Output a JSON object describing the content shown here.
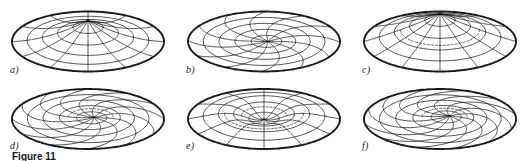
{
  "figure": {
    "kind": "multi-panel-surface-plot-figure",
    "panel_count": 6,
    "rows": 2,
    "columns": 3,
    "background_color": "#ffffff",
    "line_color": "#1a1a1a",
    "caption_fragment": "Figure 11"
  },
  "panels": [
    {
      "id": "a",
      "label": "a)",
      "shape": "shallow dome with single apex at centre, uniform radial mesh",
      "meridians": 12,
      "parallels": 4,
      "apex_offset_x": 0,
      "apex_offset_y": -4,
      "apex_height": 17,
      "twist": 0,
      "dip": 0,
      "cone": 0
    },
    {
      "id": "b",
      "label": "b)",
      "shape": "saddle / twisted sheet, mesh wraps through an off-centre node",
      "meridians": 12,
      "parallels": 4,
      "apex_offset_x": 4,
      "apex_offset_y": 2,
      "apex_height": 2,
      "twist": 0.55,
      "dip": 0,
      "cone": 0
    },
    {
      "id": "c",
      "label": "c)",
      "shape": "central cone rising from a circular rim, dashed hidden parallel",
      "meridians": 12,
      "parallels": 4,
      "apex_offset_x": 0,
      "apex_offset_y": -6,
      "apex_height": 22,
      "twist": 0,
      "dip": 0,
      "cone": 1
    },
    {
      "id": "d",
      "label": "d)",
      "shape": "spiral vortex, mesh lines converge into an off-centre singular point",
      "meridians": 12,
      "parallels": 4,
      "apex_offset_x": 6,
      "apex_offset_y": 1,
      "apex_height": 6,
      "twist": 1.05,
      "dip": 0.35,
      "cone": 0
    },
    {
      "id": "e",
      "label": "e)",
      "shape": "central funnel / depression with raised annular ring",
      "meridians": 12,
      "parallels": 4,
      "apex_offset_x": 0,
      "apex_offset_y": -3,
      "apex_height": 14,
      "twist": 0,
      "dip": 0.8,
      "cone": 1
    },
    {
      "id": "f",
      "label": "f)",
      "shape": "strongly twisted sheet, meridians sweep past an off-centre focus",
      "meridians": 12,
      "parallels": 4,
      "apex_offset_x": 10,
      "apex_offset_y": 0,
      "apex_height": 4,
      "twist": 1.4,
      "dip": 0.15,
      "cone": 0
    }
  ],
  "chart_data": {
    "type": "line",
    "title": "",
    "xlabel": "",
    "ylabel": "",
    "subplots": [
      {
        "label": "a)",
        "description": "shallow dome, 12 meridians x 4 parallels, apex centred"
      },
      {
        "label": "b)",
        "description": "saddle sheet, 12 meridians x 4 parallels, node off-centre"
      },
      {
        "label": "c)",
        "description": "central cone, 12 meridians x 4 parallels, dashed hidden edge"
      },
      {
        "label": "d)",
        "description": "spiral vortex, 12 meridians x 4 parallels, twist 1.05"
      },
      {
        "label": "e)",
        "description": "central funnel, 12 meridians x 4 parallels, dip 0.8"
      },
      {
        "label": "f)",
        "description": "twisted sheet, 12 meridians x 4 parallels, twist 1.4"
      }
    ],
    "rim_semi_major_px": 76,
    "rim_semi_minor_px": 30,
    "grid": true,
    "legend": "none"
  }
}
